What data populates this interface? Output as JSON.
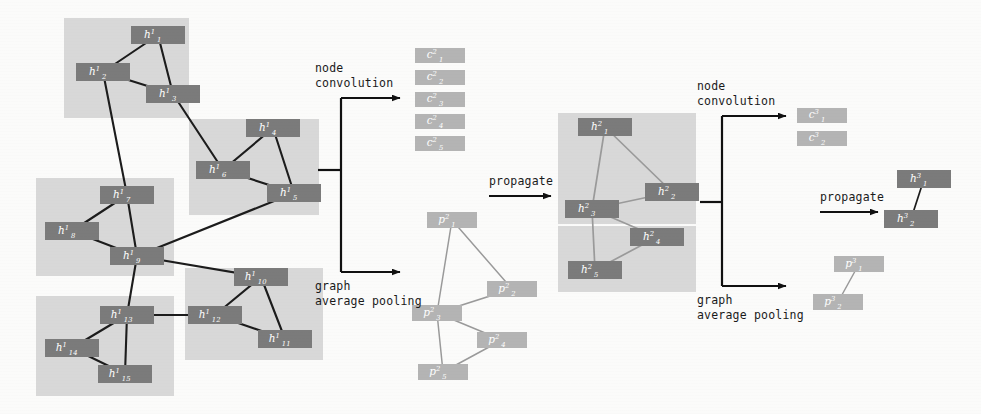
{
  "colors": {
    "node_dark": "#7b7b7b",
    "node_light": "#b4b4b4",
    "cluster_bg": "#d8d8d8",
    "edge_dark": "#1c1c1c",
    "edge_light": "#9a9a9a",
    "arrow": "#111111",
    "text": "#1a1a1a",
    "node_text": "#ffffff",
    "page_bg": "#fbfbfa"
  },
  "labels": {
    "node_convolution_1": "node\nconvolution",
    "node_convolution_2": "node\nconvolution",
    "graph_average_pooling_1": "graph\naverage pooling",
    "graph_average_pooling_2": "graph\naverage pooling",
    "propagate_1": "propagate",
    "propagate_2": "propagate"
  },
  "layer1": {
    "title": "input graph layer 1",
    "clusters": [
      {
        "id": "c1",
        "x": 64,
        "y": 18,
        "w": 125,
        "h": 100
      },
      {
        "id": "c2",
        "x": 189,
        "y": 119,
        "w": 130,
        "h": 96
      },
      {
        "id": "c3",
        "x": 36,
        "y": 178,
        "w": 138,
        "h": 98
      },
      {
        "id": "c4",
        "x": 185,
        "y": 268,
        "w": 138,
        "h": 92
      },
      {
        "id": "c5",
        "x": 36,
        "y": 296,
        "w": 138,
        "h": 100
      }
    ],
    "nodes": [
      {
        "id": "h1_1",
        "base": "h",
        "sup": "1",
        "sub": "1",
        "x": 131,
        "y": 26,
        "w": 54,
        "h": 18
      },
      {
        "id": "h1_2",
        "base": "h",
        "sup": "1",
        "sub": "2",
        "x": 76,
        "y": 63,
        "w": 54,
        "h": 18
      },
      {
        "id": "h1_3",
        "base": "h",
        "sup": "1",
        "sub": "3",
        "x": 146,
        "y": 85,
        "w": 54,
        "h": 18
      },
      {
        "id": "h1_4",
        "base": "h",
        "sup": "1",
        "sub": "4",
        "x": 246,
        "y": 119,
        "w": 54,
        "h": 18
      },
      {
        "id": "h1_6",
        "base": "h",
        "sup": "1",
        "sub": "6",
        "x": 196,
        "y": 161,
        "w": 54,
        "h": 18
      },
      {
        "id": "h1_5",
        "base": "h",
        "sup": "1",
        "sub": "5",
        "x": 267,
        "y": 184,
        "w": 54,
        "h": 18
      },
      {
        "id": "h1_7",
        "base": "h",
        "sup": "1",
        "sub": "7",
        "x": 100,
        "y": 186,
        "w": 54,
        "h": 18
      },
      {
        "id": "h1_8",
        "base": "h",
        "sup": "1",
        "sub": "8",
        "x": 45,
        "y": 222,
        "w": 54,
        "h": 18
      },
      {
        "id": "h1_9",
        "base": "h",
        "sup": "1",
        "sub": "9",
        "x": 110,
        "y": 247,
        "w": 54,
        "h": 18
      },
      {
        "id": "h1_10",
        "base": "h",
        "sup": "1",
        "sub": "10",
        "x": 234,
        "y": 268,
        "w": 54,
        "h": 18
      },
      {
        "id": "h1_13",
        "base": "h",
        "sup": "1",
        "sub": "13",
        "x": 100,
        "y": 306,
        "w": 54,
        "h": 18
      },
      {
        "id": "h1_12",
        "base": "h",
        "sup": "1",
        "sub": "12",
        "x": 188,
        "y": 306,
        "w": 54,
        "h": 18
      },
      {
        "id": "h1_11",
        "base": "h",
        "sup": "1",
        "sub": "11",
        "x": 258,
        "y": 330,
        "w": 54,
        "h": 18
      },
      {
        "id": "h1_14",
        "base": "h",
        "sup": "1",
        "sub": "14",
        "x": 45,
        "y": 339,
        "w": 54,
        "h": 18
      },
      {
        "id": "h1_15",
        "base": "h",
        "sup": "1",
        "sub": "15",
        "x": 98,
        "y": 365,
        "w": 54,
        "h": 18
      }
    ],
    "edges": [
      [
        "h1_1",
        "h1_2"
      ],
      [
        "h1_1",
        "h1_3"
      ],
      [
        "h1_2",
        "h1_3"
      ],
      [
        "h1_2",
        "h1_7"
      ],
      [
        "h1_3",
        "h1_6"
      ],
      [
        "h1_4",
        "h1_6"
      ],
      [
        "h1_4",
        "h1_5"
      ],
      [
        "h1_6",
        "h1_5"
      ],
      [
        "h1_7",
        "h1_8"
      ],
      [
        "h1_7",
        "h1_9"
      ],
      [
        "h1_8",
        "h1_9"
      ],
      [
        "h1_5",
        "h1_9"
      ],
      [
        "h1_9",
        "h1_10"
      ],
      [
        "h1_9",
        "h1_13"
      ],
      [
        "h1_10",
        "h1_12"
      ],
      [
        "h1_10",
        "h1_11"
      ],
      [
        "h1_12",
        "h1_11"
      ],
      [
        "h1_13",
        "h1_12"
      ],
      [
        "h1_13",
        "h1_14"
      ],
      [
        "h1_13",
        "h1_15"
      ],
      [
        "h1_14",
        "h1_15"
      ]
    ]
  },
  "conv_out_1": {
    "nodes": [
      {
        "id": "c2_1",
        "base": "c",
        "sup": "2",
        "sub": "1",
        "x": 415,
        "y": 48,
        "w": 50,
        "h": 15
      },
      {
        "id": "c2_2",
        "base": "c",
        "sup": "2",
        "sub": "2",
        "x": 415,
        "y": 70,
        "w": 50,
        "h": 15
      },
      {
        "id": "c2_3",
        "base": "c",
        "sup": "2",
        "sub": "3",
        "x": 415,
        "y": 92,
        "w": 50,
        "h": 15
      },
      {
        "id": "c2_4",
        "base": "c",
        "sup": "2",
        "sub": "4",
        "x": 415,
        "y": 114,
        "w": 50,
        "h": 15
      },
      {
        "id": "c2_5",
        "base": "c",
        "sup": "2",
        "sub": "5",
        "x": 415,
        "y": 136,
        "w": 50,
        "h": 15
      }
    ]
  },
  "pool_out_1": {
    "nodes": [
      {
        "id": "p2_1",
        "base": "p",
        "sup": "2",
        "sub": "1",
        "x": 427,
        "y": 212,
        "w": 50,
        "h": 16
      },
      {
        "id": "p2_2",
        "base": "p",
        "sup": "2",
        "sub": "2",
        "x": 487,
        "y": 281,
        "w": 50,
        "h": 16
      },
      {
        "id": "p2_3",
        "base": "p",
        "sup": "2",
        "sub": "3",
        "x": 412,
        "y": 305,
        "w": 50,
        "h": 16
      },
      {
        "id": "p2_4",
        "base": "p",
        "sup": "2",
        "sub": "4",
        "x": 477,
        "y": 332,
        "w": 50,
        "h": 16
      },
      {
        "id": "p2_5",
        "base": "p",
        "sup": "2",
        "sub": "5",
        "x": 418,
        "y": 364,
        "w": 50,
        "h": 16
      }
    ],
    "edges": [
      [
        "p2_1",
        "p2_2"
      ],
      [
        "p2_1",
        "p2_3"
      ],
      [
        "p2_2",
        "p2_3"
      ],
      [
        "p2_3",
        "p2_4"
      ],
      [
        "p2_3",
        "p2_5"
      ],
      [
        "p2_4",
        "p2_5"
      ]
    ]
  },
  "layer2": {
    "title": "graph layer 2",
    "clusters": [
      {
        "id": "k1",
        "x": 558,
        "y": 113,
        "w": 138,
        "h": 111
      },
      {
        "id": "k2",
        "x": 558,
        "y": 226,
        "w": 138,
        "h": 66
      }
    ],
    "nodes": [
      {
        "id": "h2_1",
        "base": "h",
        "sup": "2",
        "sub": "1",
        "x": 578,
        "y": 118,
        "w": 54,
        "h": 18
      },
      {
        "id": "h2_2",
        "base": "h",
        "sup": "2",
        "sub": "2",
        "x": 645,
        "y": 183,
        "w": 54,
        "h": 18
      },
      {
        "id": "h2_3",
        "base": "h",
        "sup": "2",
        "sub": "3",
        "x": 565,
        "y": 200,
        "w": 54,
        "h": 18
      },
      {
        "id": "h2_4",
        "base": "h",
        "sup": "2",
        "sub": "4",
        "x": 630,
        "y": 228,
        "w": 54,
        "h": 18
      },
      {
        "id": "h2_5",
        "base": "h",
        "sup": "2",
        "sub": "5",
        "x": 568,
        "y": 261,
        "w": 54,
        "h": 18
      }
    ],
    "edges": [
      [
        "h2_1",
        "h2_2"
      ],
      [
        "h2_1",
        "h2_3"
      ],
      [
        "h2_2",
        "h2_3"
      ],
      [
        "h2_3",
        "h2_4"
      ],
      [
        "h2_3",
        "h2_5"
      ],
      [
        "h2_4",
        "h2_5"
      ]
    ]
  },
  "conv_out_2": {
    "nodes": [
      {
        "id": "c3_1",
        "base": "c",
        "sup": "3",
        "sub": "1",
        "x": 797,
        "y": 108,
        "w": 50,
        "h": 15
      },
      {
        "id": "c3_2",
        "base": "c",
        "sup": "3",
        "sub": "2",
        "x": 797,
        "y": 131,
        "w": 50,
        "h": 15
      }
    ]
  },
  "pool_out_2": {
    "nodes": [
      {
        "id": "p3_1",
        "base": "p",
        "sup": "3",
        "sub": "1",
        "x": 834,
        "y": 256,
        "w": 50,
        "h": 16
      },
      {
        "id": "p3_2",
        "base": "p",
        "sup": "3",
        "sub": "2",
        "x": 813,
        "y": 294,
        "w": 50,
        "h": 16
      }
    ],
    "edges": [
      [
        "p3_1",
        "p3_2"
      ]
    ]
  },
  "layer3": {
    "title": "graph layer 3",
    "nodes": [
      {
        "id": "h3_1",
        "base": "h",
        "sup": "3",
        "sub": "1",
        "x": 897,
        "y": 170,
        "w": 54,
        "h": 18
      },
      {
        "id": "h3_2",
        "base": "h",
        "sup": "3",
        "sub": "2",
        "x": 884,
        "y": 210,
        "w": 54,
        "h": 18
      }
    ],
    "edges": [
      [
        "h3_1",
        "h3_2"
      ]
    ]
  },
  "connectors": {
    "fork1": {
      "stub_x": 318,
      "stub_y": 170,
      "bar_x": 341,
      "top_y": 98,
      "bot_y": 272,
      "arrow_end_x": 400
    },
    "fork2": {
      "stub_x": 700,
      "stub_y": 202,
      "bar_x": 722,
      "top_y": 116,
      "bot_y": 286,
      "arrow_end_x": 786
    },
    "arrow_prop1": {
      "x1": 489,
      "y1": 196,
      "x2": 551,
      "y2": 196,
      "label_x": 489,
      "label_y": 185
    },
    "arrow_prop2": {
      "x1": 820,
      "y1": 212,
      "x2": 878,
      "y2": 212,
      "label_x": 820,
      "label_y": 201
    }
  }
}
